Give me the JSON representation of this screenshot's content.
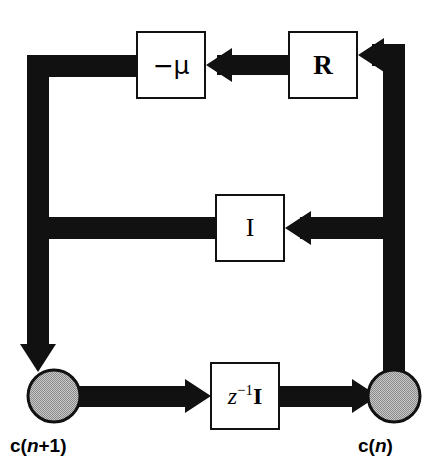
{
  "diagram": {
    "background_color": "#ffffff",
    "line_color": "#111111",
    "node_fill_color": "#a8a8a8",
    "box_fill_color": "#ffffff"
  },
  "blocks": [
    {
      "id": "mu",
      "name": "gain-block-minus-mu",
      "label": "−μ",
      "x": 136,
      "y": 31,
      "w": 70,
      "h": 68
    },
    {
      "id": "r",
      "name": "matrix-block-R",
      "label": "R",
      "x": 288,
      "y": 31,
      "w": 70,
      "h": 68
    },
    {
      "id": "i",
      "name": "identity-block-I",
      "label": "I",
      "x": 215,
      "y": 194,
      "w": 70,
      "h": 68
    },
    {
      "id": "delay",
      "name": "delay-block-z-inverse-I",
      "label_z": "z",
      "label_exp": "−1",
      "label_mat": "I",
      "label_full": "z−1I",
      "x": 210,
      "y": 362,
      "w": 70,
      "h": 68
    }
  ],
  "nodes": [
    {
      "id": "left",
      "name": "summing-node-c-n-plus-1",
      "label_bold": "c",
      "label_open": "(",
      "label_italic": "n",
      "label_rest": "+1)",
      "label_full": "c(n+1)",
      "cx": 54,
      "cy": 396,
      "r": 27
    },
    {
      "id": "right",
      "name": "summing-node-c-n",
      "label_bold": "c",
      "label_open": "(",
      "label_italic": "n",
      "label_rest": ")",
      "label_full": "c(n)",
      "cx": 394,
      "cy": 396,
      "r": 27
    }
  ],
  "connections": [
    {
      "id": "c1",
      "name": "edge-node-right-to-R",
      "from": "node-right",
      "to": "block-r",
      "direction": "left",
      "arrowhead": true
    },
    {
      "id": "c2",
      "name": "edge-R-to-minus-mu",
      "from": "block-r",
      "to": "block-mu",
      "direction": "left",
      "arrowhead": true
    },
    {
      "id": "c3",
      "name": "edge-minus-mu-to-node-left",
      "from": "block-mu",
      "to": "node-left",
      "direction": "down",
      "arrowhead": true
    },
    {
      "id": "c4",
      "name": "edge-node-right-to-I",
      "from": "node-right",
      "to": "block-i",
      "direction": "left",
      "arrowhead": true
    },
    {
      "id": "c5",
      "name": "edge-I-to-node-left",
      "from": "block-i",
      "to": "node-left",
      "direction": "left",
      "arrowhead": false
    },
    {
      "id": "c6",
      "name": "edge-node-left-to-delay",
      "from": "node-left",
      "to": "block-delay",
      "direction": "right",
      "arrowhead": true
    },
    {
      "id": "c7",
      "name": "edge-delay-to-node-right",
      "from": "block-delay",
      "to": "node-right",
      "direction": "right",
      "arrowhead": true
    }
  ]
}
